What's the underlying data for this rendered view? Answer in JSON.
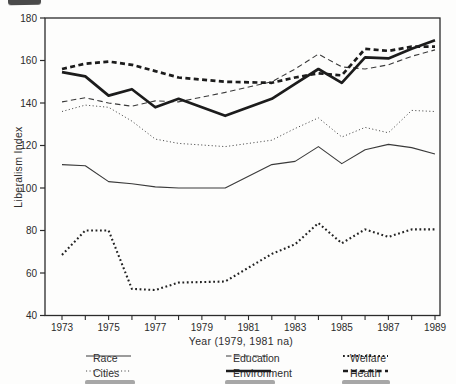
{
  "colors": {
    "ink": "#2b2b2b",
    "line_dark": "#1c1c1c",
    "line_mid": "#3a3a3a"
  },
  "chart_data": {
    "type": "line",
    "title": "",
    "xlabel": "Year (1979, 1981 na)",
    "ylabel": "Liberalism Index",
    "x": [
      1973,
      1974,
      1975,
      1976,
      1977,
      1978,
      1979,
      1980,
      1981,
      1982,
      1983,
      1984,
      1985,
      1986,
      1987,
      1988,
      1989
    ],
    "x_tick_labels": [
      "1973",
      "1975",
      "1977",
      "1979",
      "1981",
      "1983",
      "1985",
      "1987",
      "1989"
    ],
    "na_years": [
      1979,
      1981
    ],
    "ylim": [
      40,
      180
    ],
    "y_ticks": [
      40,
      60,
      80,
      100,
      120,
      140,
      160,
      180
    ],
    "y_tick_labels": [
      "40",
      "60",
      "80",
      "100",
      "120",
      "140",
      "160",
      "180"
    ],
    "grid": false,
    "series": [
      {
        "name": "Race",
        "style": "solid-thin",
        "values": [
          111,
          110.5,
          103,
          102,
          100.5,
          100,
          null,
          100,
          null,
          111,
          112.5,
          119.5,
          111.5,
          118,
          120.5,
          119,
          116
        ]
      },
      {
        "name": "Cities",
        "style": "dotted-thin",
        "values": [
          136,
          139,
          138,
          131.5,
          123,
          121,
          null,
          119.5,
          null,
          122.5,
          128,
          133,
          124,
          128.5,
          126,
          136.5,
          136
        ]
      },
      {
        "name": "Education",
        "style": "dashed-thin",
        "values": [
          140.5,
          142.5,
          140,
          138.5,
          141,
          140.5,
          null,
          145,
          null,
          150,
          156,
          163,
          157,
          156,
          158,
          162,
          165
        ]
      },
      {
        "name": "Environment",
        "style": "solid-thick",
        "values": [
          154.5,
          152.5,
          143.5,
          146.5,
          138,
          142,
          null,
          134,
          null,
          142,
          149,
          156,
          149.5,
          161.5,
          161,
          165.5,
          169.5
        ]
      },
      {
        "name": "Welfare",
        "style": "dotted-thick",
        "values": [
          68.5,
          80,
          80,
          52.5,
          52,
          55.5,
          null,
          56,
          null,
          69,
          73.5,
          83.5,
          74,
          80.5,
          77,
          80.5,
          80.5
        ]
      },
      {
        "name": "Health",
        "style": "dashed-thick",
        "values": [
          156,
          158.5,
          159.5,
          158,
          155,
          152,
          null,
          150,
          null,
          149.5,
          152,
          154,
          153,
          165.5,
          164.5,
          166.5,
          166.5
        ]
      }
    ],
    "legend": {
      "position": "bottom",
      "rows": [
        [
          "Race",
          "Education",
          "Welfare"
        ],
        [
          "Cities",
          "Environment",
          "Health"
        ]
      ]
    }
  }
}
